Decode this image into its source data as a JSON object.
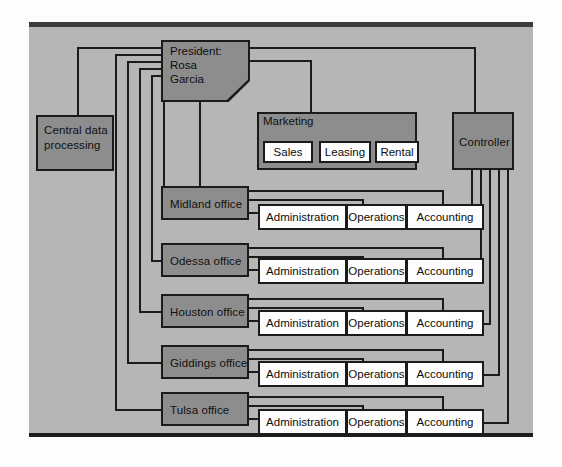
{
  "diagram": {
    "colors": {
      "panel_background": "#b6b6b6",
      "node_fill": "#8d8d8d",
      "leaf_fill": "#fdfdfd",
      "line": "#1b1b1b"
    }
  },
  "president": {
    "line1": "President:",
    "line2": "Rosa",
    "line3": "Garcia"
  },
  "central_data_processing": {
    "label": "Central data processing"
  },
  "marketing": {
    "label": "Marketing",
    "subunits": [
      {
        "label": "Sales"
      },
      {
        "label": "Leasing"
      },
      {
        "label": "Rental"
      }
    ]
  },
  "controller": {
    "label": "Controller"
  },
  "departments": [
    "Administration",
    "Operations",
    "Accounting"
  ],
  "offices": [
    {
      "label": "Midland office",
      "departments": [
        "Administration",
        "Operations",
        "Accounting"
      ]
    },
    {
      "label": "Odessa office",
      "departments": [
        "Administration",
        "Operations",
        "Accounting"
      ]
    },
    {
      "label": "Houston office",
      "departments": [
        "Administration",
        "Operations",
        "Accounting"
      ]
    },
    {
      "label": "Giddings office",
      "departments": [
        "Administration",
        "Operations",
        "Accounting"
      ]
    },
    {
      "label": "Tulsa office",
      "departments": [
        "Administration",
        "Operations",
        "Accounting"
      ]
    }
  ]
}
